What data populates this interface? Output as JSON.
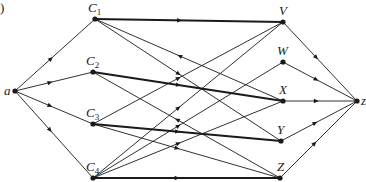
{
  "figure": {
    "label_fragment": ")",
    "nodes": [
      {
        "id": "a",
        "label": "a",
        "sub": "",
        "x": 15,
        "y": 91,
        "lx": 4,
        "ly": 95
      },
      {
        "id": "C1",
        "label": "C",
        "sub": "1",
        "x": 95,
        "y": 19,
        "lx": 88,
        "ly": 12
      },
      {
        "id": "C2",
        "label": "C",
        "sub": "2",
        "x": 93,
        "y": 72,
        "lx": 86,
        "ly": 65
      },
      {
        "id": "C3",
        "label": "C",
        "sub": "3",
        "x": 93,
        "y": 124,
        "lx": 86,
        "ly": 117
      },
      {
        "id": "C4",
        "label": "C",
        "sub": "4",
        "x": 93,
        "y": 178,
        "lx": 86,
        "ly": 171
      },
      {
        "id": "V",
        "label": "V",
        "sub": "",
        "x": 283,
        "y": 22,
        "lx": 279,
        "ly": 15
      },
      {
        "id": "W",
        "label": "W",
        "sub": "",
        "x": 283,
        "y": 62,
        "lx": 277,
        "ly": 55
      },
      {
        "id": "X",
        "label": "X",
        "sub": "",
        "x": 283,
        "y": 101,
        "lx": 279,
        "ly": 94
      },
      {
        "id": "Y",
        "label": "Y",
        "sub": "",
        "x": 281,
        "y": 141,
        "lx": 277,
        "ly": 134
      },
      {
        "id": "Z",
        "label": "Z",
        "sub": "",
        "x": 280,
        "y": 178,
        "lx": 277,
        "ly": 171
      },
      {
        "id": "z",
        "label": "z",
        "sub": "",
        "x": 357,
        "y": 101,
        "lx": 361,
        "ly": 105
      }
    ],
    "edges": [
      {
        "from": "a",
        "to": "C1",
        "thick": false,
        "arrow": "forward"
      },
      {
        "from": "a",
        "to": "C2",
        "thick": false,
        "arrow": "forward"
      },
      {
        "from": "a",
        "to": "C3",
        "thick": false,
        "arrow": "forward"
      },
      {
        "from": "a",
        "to": "C4",
        "thick": false,
        "arrow": "forward"
      },
      {
        "from": "C1",
        "to": "V",
        "thick": true,
        "arrow": "forward"
      },
      {
        "from": "C1",
        "to": "X",
        "thick": false,
        "arrow": "backward"
      },
      {
        "from": "C1",
        "to": "Y",
        "thick": false,
        "arrow": "forward"
      },
      {
        "from": "C2",
        "to": "X",
        "thick": true,
        "arrow": "forward"
      },
      {
        "from": "C2",
        "to": "Z",
        "thick": false,
        "arrow": "backward"
      },
      {
        "from": "C3",
        "to": "V",
        "thick": false,
        "arrow": "forward"
      },
      {
        "from": "C3",
        "to": "Y",
        "thick": true,
        "arrow": "forward"
      },
      {
        "from": "C3",
        "to": "Z",
        "thick": false,
        "arrow": "forward"
      },
      {
        "from": "C4",
        "to": "V",
        "thick": false,
        "arrow": "forward"
      },
      {
        "from": "C4",
        "to": "W",
        "thick": false,
        "arrow": "forward"
      },
      {
        "from": "C4",
        "to": "X",
        "thick": false,
        "arrow": "forward"
      },
      {
        "from": "C4",
        "to": "Z",
        "thick": true,
        "arrow": "forward"
      },
      {
        "from": "V",
        "to": "z",
        "thick": false,
        "arrow": "forward"
      },
      {
        "from": "W",
        "to": "z",
        "thick": false,
        "arrow": "forward"
      },
      {
        "from": "X",
        "to": "z",
        "thick": false,
        "arrow": "forward"
      },
      {
        "from": "Y",
        "to": "z",
        "thick": false,
        "arrow": "forward"
      },
      {
        "from": "Z",
        "to": "z",
        "thick": false,
        "arrow": "forward"
      }
    ],
    "colors": {
      "line": "#1a1a1a",
      "background": "#ffffff"
    }
  }
}
